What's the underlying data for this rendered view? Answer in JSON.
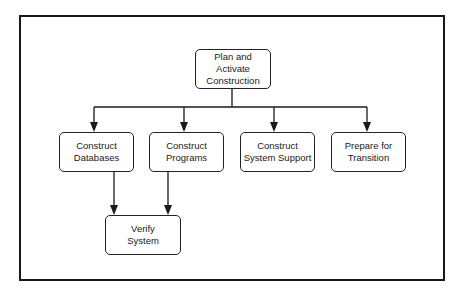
{
  "diagram": {
    "type": "hierarchy-flow",
    "nodes": [
      {
        "id": "plan",
        "line1": "Plan and Activate",
        "line2": "Construction"
      },
      {
        "id": "databases",
        "line1": "Construct",
        "line2": "Databases"
      },
      {
        "id": "programs",
        "line1": "Construct",
        "line2": "Programs"
      },
      {
        "id": "system_support",
        "line1": "Construct",
        "line2": "System Support"
      },
      {
        "id": "transition",
        "line1": "Prepare for",
        "line2": "Transition"
      },
      {
        "id": "verify",
        "line1": "Verify",
        "line2": "System"
      }
    ],
    "edges": [
      {
        "from": "plan",
        "to": "databases"
      },
      {
        "from": "plan",
        "to": "programs"
      },
      {
        "from": "plan",
        "to": "system_support"
      },
      {
        "from": "plan",
        "to": "transition"
      },
      {
        "from": "databases",
        "to": "verify"
      },
      {
        "from": "programs",
        "to": "verify"
      }
    ],
    "colors": {
      "stroke": "#1a1a1a",
      "fill": "#ffffff",
      "text": "#1a1a1a"
    }
  }
}
